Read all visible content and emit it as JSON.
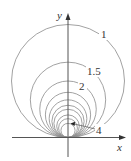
{
  "diagram": {
    "type": "level-curves",
    "axes": {
      "x_label": "x",
      "y_label": "y"
    },
    "colors": {
      "curve": "#8a8a8a",
      "axis": "#555555",
      "label": "#333333"
    },
    "level_values": [
      1,
      1.5,
      2,
      2.5,
      3,
      3.5,
      4,
      5,
      6,
      8
    ],
    "labels": [
      {
        "text": "1",
        "level": 1
      },
      {
        "text": "1.5",
        "level": 1.5
      },
      {
        "text": "2",
        "level": 2
      },
      {
        "text": "4",
        "level": 4
      }
    ]
  }
}
